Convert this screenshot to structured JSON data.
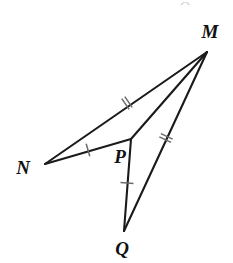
{
  "figure": {
    "kind": "geometry-diagram",
    "background_color": "#ffffff",
    "stroke_color": "#1a1a1a",
    "tick_color": "#6b6b6b",
    "label_color": "#111111",
    "width": 233,
    "height": 263
  },
  "points": [
    {
      "id": "M",
      "label": "M",
      "x": 207,
      "y": 52,
      "label_x": 210,
      "label_y": 31
    },
    {
      "id": "N",
      "label": "N",
      "x": 45,
      "y": 164,
      "label_x": 23,
      "label_y": 167
    },
    {
      "id": "P",
      "label": "P",
      "x": 131,
      "y": 139,
      "label_x": 120,
      "label_y": 156
    },
    {
      "id": "Q",
      "label": "Q",
      "x": 124,
      "y": 231,
      "label_x": 122,
      "label_y": 248
    }
  ],
  "segments": [
    {
      "id": "NM",
      "from": "N",
      "to": "M",
      "ticks": 2,
      "tick_x": 127,
      "tick_y": 103
    },
    {
      "id": "NP",
      "from": "N",
      "to": "P",
      "ticks": 1,
      "tick_x": 88,
      "tick_y": 150
    },
    {
      "id": "PM",
      "from": "P",
      "to": "M",
      "ticks": 0
    },
    {
      "id": "PQ",
      "from": "P",
      "to": "Q",
      "ticks": 1,
      "tick_x": 127,
      "tick_y": 183
    },
    {
      "id": "QM",
      "from": "Q",
      "to": "M",
      "ticks": 2,
      "tick_x": 166,
      "tick_y": 138
    }
  ],
  "artifact": {
    "text": "Q"
  }
}
